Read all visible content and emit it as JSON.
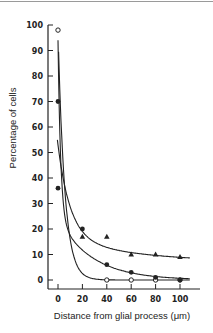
{
  "chart_data": {
    "type": "scatter",
    "title": "",
    "xlabel": "Distance from glial process (μm)",
    "ylabel": "Percentage of cells",
    "xlim": [
      -5,
      110
    ],
    "ylim": [
      0,
      100
    ],
    "x_ticks": [
      0,
      20,
      40,
      60,
      80,
      100
    ],
    "y_ticks": [
      0,
      10,
      20,
      30,
      40,
      50,
      60,
      70,
      80,
      90,
      100
    ],
    "grid": false,
    "legend": null,
    "series": [
      {
        "name": "open circles",
        "marker": "open-circle",
        "x": [
          0,
          40,
          60,
          80,
          100
        ],
        "y": [
          98,
          0,
          0,
          0,
          0
        ]
      },
      {
        "name": "filled circles",
        "marker": "filled-circle",
        "x": [
          0,
          0,
          20,
          40,
          60,
          80,
          100
        ],
        "y": [
          70,
          36,
          20,
          6,
          3,
          1,
          0
        ]
      },
      {
        "name": "filled triangles",
        "marker": "filled-triangle",
        "x": [
          20,
          40,
          60,
          80,
          100
        ],
        "y": [
          17,
          17,
          10,
          10,
          9
        ]
      }
    ]
  },
  "labels": {
    "xlabel": "Distance from glial process (μm)",
    "ylabel": "Percentage of cells"
  }
}
